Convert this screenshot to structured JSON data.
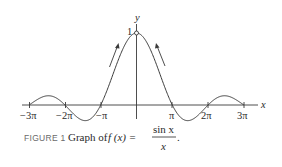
{
  "figure": {
    "axis_labels": {
      "x": "x",
      "y": "y"
    },
    "y_tick": "1",
    "x_ticks": [
      "−3π",
      "−2π",
      "−π",
      "π",
      "2π",
      "3π"
    ],
    "caption": {
      "number": "FIGURE 1",
      "text": "Graph of",
      "function_lhs": "f (x) =",
      "numerator": "sin x",
      "denominator": "x",
      "period": "."
    }
  },
  "chart_data": {
    "type": "line",
    "xlabel": "x",
    "ylabel": "y",
    "function": "sin(x)/x",
    "xlim": [
      "-3π",
      "3π"
    ],
    "x_ticks": [
      "-3π",
      "-2π",
      "-π",
      "π",
      "2π",
      "3π"
    ],
    "y_ticks": [
      1
    ],
    "zeros": [
      "-3π",
      "-2π",
      "-π",
      "π",
      "2π",
      "3π"
    ],
    "hole_at": {
      "x": 0,
      "y": 1
    },
    "annotations": [
      "arrows pointing toward (0,1) along curve from both sides"
    ],
    "grid": false
  },
  "colors": {
    "line": "#3a3a3a",
    "text": "#2a2a2a",
    "caption_label": "#6a6a6a"
  }
}
